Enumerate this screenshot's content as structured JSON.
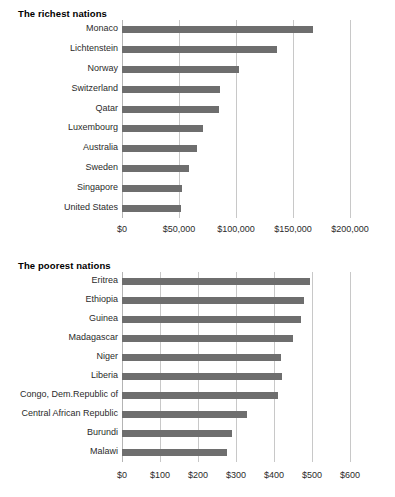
{
  "chart_data": [
    {
      "type": "bar",
      "orientation": "horizontal",
      "title": "The richest nations",
      "xlabel": "",
      "ylabel": "",
      "xlim": [
        0,
        200000
      ],
      "grid": true,
      "legend": "none",
      "tick_labels": [
        "$0",
        "$50,000",
        "$100,000",
        "$150,000",
        "$200,000"
      ],
      "tick_values": [
        0,
        50000,
        100000,
        150000,
        200000
      ],
      "categories": [
        "Monaco",
        "Lichtenstein",
        "Norway",
        "Switzerland",
        "Qatar",
        "Luxembourg",
        "Australia",
        "Sweden",
        "Singapore",
        "United States"
      ],
      "values": [
        167500,
        136000,
        103000,
        86000,
        85000,
        71000,
        66000,
        59000,
        53000,
        52000
      ],
      "bar_color": "#6e6e6e"
    },
    {
      "type": "bar",
      "orientation": "horizontal",
      "title": "The poorest nations",
      "xlabel": "",
      "ylabel": "",
      "xlim": [
        0,
        600
      ],
      "grid": true,
      "legend": "none",
      "tick_labels": [
        "$0",
        "$100",
        "$200",
        "$300",
        "$400",
        "$500",
        "$600"
      ],
      "tick_values": [
        0,
        100,
        200,
        300,
        400,
        500,
        600
      ],
      "categories": [
        "Eritrea",
        "Ethiopia",
        "Guinea",
        "Madagascar",
        "Niger",
        "Liberia",
        "Congo, Dem.Republic of",
        "Central African Republic",
        "Burundi",
        "Malawi"
      ],
      "values": [
        496,
        478,
        470,
        450,
        419,
        421,
        410,
        328,
        289,
        276
      ],
      "bar_color": "#6e6e6e"
    }
  ],
  "colors": {
    "bar": "#6e6e6e",
    "gridline": "#c8c8c8",
    "text": "#2b2b2b",
    "title": "#000000",
    "background": "#ffffff"
  }
}
